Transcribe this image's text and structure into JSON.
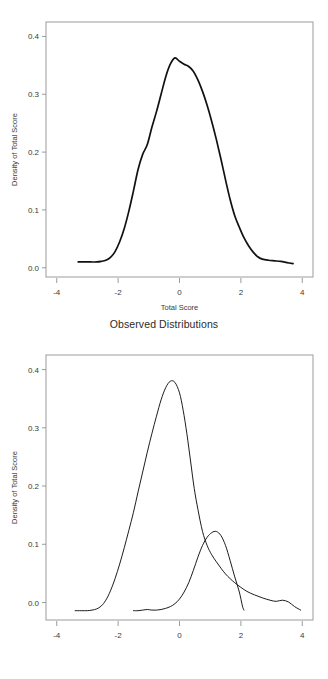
{
  "chart_data": [
    {
      "id": "observed",
      "type": "line",
      "title": "",
      "caption": "Observed Distributions",
      "xlabel": "Total Score",
      "ylabel": "Density of Total Score",
      "xlim": [
        -4.35,
        4.35
      ],
      "ylim": [
        -0.016,
        0.425
      ],
      "xticks": [
        -4,
        -2,
        0,
        2,
        4
      ],
      "xticklabels": [
        "-4",
        "-2",
        "0",
        "2",
        "4"
      ],
      "yticks": [
        0.0,
        0.1,
        0.2,
        0.3,
        0.4
      ],
      "yticklabels": [
        "0.0",
        "0.1",
        "0.2",
        "0.3",
        "0.4"
      ],
      "grid": false,
      "legend": "none",
      "series": [
        {
          "name": "Observed total score density",
          "x": [
            -3.3,
            -3.1,
            -2.9,
            -2.7,
            -2.55,
            -2.4,
            -2.25,
            -2.1,
            -1.95,
            -1.8,
            -1.65,
            -1.5,
            -1.35,
            -1.2,
            -1.05,
            -0.9,
            -0.75,
            -0.6,
            -0.45,
            -0.3,
            -0.15,
            0.0,
            0.15,
            0.3,
            0.45,
            0.6,
            0.75,
            0.9,
            1.05,
            1.2,
            1.35,
            1.5,
            1.65,
            1.8,
            1.95,
            2.1,
            2.25,
            2.4,
            2.55,
            2.7,
            2.9,
            3.1,
            3.3,
            3.5,
            3.7
          ],
          "y": [
            0.01,
            0.01,
            0.01,
            0.01,
            0.011,
            0.013,
            0.018,
            0.028,
            0.045,
            0.068,
            0.098,
            0.133,
            0.17,
            0.196,
            0.213,
            0.243,
            0.27,
            0.3,
            0.33,
            0.352,
            0.363,
            0.357,
            0.352,
            0.348,
            0.34,
            0.325,
            0.305,
            0.281,
            0.253,
            0.222,
            0.188,
            0.152,
            0.118,
            0.09,
            0.07,
            0.052,
            0.038,
            0.027,
            0.019,
            0.015,
            0.013,
            0.012,
            0.011,
            0.009,
            0.007
          ]
        }
      ]
    },
    {
      "id": "latent",
      "type": "line",
      "title": "",
      "caption": "Latent Distributions",
      "xlabel": "Total Score",
      "ylabel": "Density of Total Score",
      "xlim": [
        -4.35,
        4.35
      ],
      "ylim": [
        -0.03,
        0.425
      ],
      "xticks": [
        -4,
        -2,
        0,
        2,
        4
      ],
      "xticklabels": [
        "-4",
        "-2",
        "0",
        "2",
        "4"
      ],
      "yticks": [
        0.0,
        0.1,
        0.2,
        0.3,
        0.4
      ],
      "yticklabels": [
        "0.0",
        "0.1",
        "0.2",
        "0.3",
        "0.4"
      ],
      "grid": false,
      "legend": "none",
      "series": [
        {
          "name": "Latent distribution 1",
          "x": [
            -3.4,
            -3.2,
            -3.0,
            -2.85,
            -2.7,
            -2.55,
            -2.4,
            -2.25,
            -2.1,
            -1.95,
            -1.8,
            -1.65,
            -1.5,
            -1.35,
            -1.2,
            -1.05,
            -0.9,
            -0.75,
            -0.6,
            -0.45,
            -0.3,
            -0.15,
            0.0,
            0.12,
            0.24,
            0.36,
            0.48,
            0.6,
            0.75,
            0.9,
            1.05,
            1.2,
            1.35,
            1.5,
            1.65,
            1.8,
            2.0,
            2.2,
            2.45,
            2.7,
            2.95,
            3.15,
            3.35,
            3.55,
            3.75,
            3.95
          ],
          "y": [
            -0.014,
            -0.014,
            -0.014,
            -0.013,
            -0.011,
            -0.006,
            0.004,
            0.02,
            0.041,
            0.066,
            0.094,
            0.124,
            0.155,
            0.19,
            0.224,
            0.258,
            0.29,
            0.32,
            0.348,
            0.369,
            0.38,
            0.378,
            0.36,
            0.33,
            0.29,
            0.243,
            0.196,
            0.16,
            0.122,
            0.098,
            0.082,
            0.07,
            0.059,
            0.049,
            0.041,
            0.034,
            0.026,
            0.019,
            0.013,
            0.008,
            0.004,
            0.002,
            0.004,
            0.001,
            -0.007,
            -0.013
          ]
        },
        {
          "name": "Latent distribution 2",
          "x": [
            -1.5,
            -1.35,
            -1.2,
            -1.05,
            -0.9,
            -0.75,
            -0.6,
            -0.45,
            -0.3,
            -0.15,
            0.0,
            0.15,
            0.3,
            0.45,
            0.6,
            0.75,
            0.9,
            1.05,
            1.2,
            1.35,
            1.5,
            1.65,
            1.8,
            1.95,
            2.05,
            2.1
          ],
          "y": [
            -0.014,
            -0.014,
            -0.013,
            -0.012,
            -0.013,
            -0.013,
            -0.012,
            -0.01,
            -0.007,
            -0.002,
            0.006,
            0.018,
            0.034,
            0.055,
            0.078,
            0.098,
            0.112,
            0.12,
            0.122,
            0.115,
            0.098,
            0.072,
            0.044,
            0.018,
            -0.006,
            -0.013
          ]
        }
      ]
    }
  ],
  "figures": {
    "observed": {
      "caption": "Observed Distributions",
      "xlabel": "Total Score",
      "ylabel": "Density of Total Score"
    },
    "latent": {
      "caption": "Latent Distributions",
      "xlabel": "Total Score",
      "ylabel": "Density of Total Score"
    }
  }
}
